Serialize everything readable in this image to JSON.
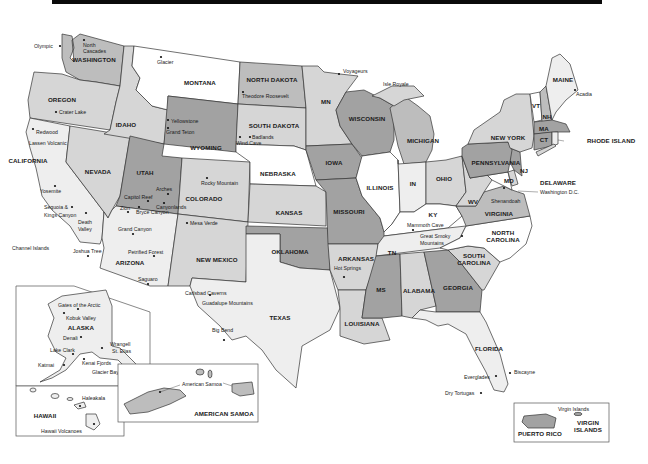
{
  "map": {
    "type": "US National Parks reference map",
    "colors": {
      "white": "#ffffff",
      "light": "#eeeeee",
      "medium": "#d6d6d6",
      "mediumdark": "#bdbdbd",
      "dark": "#a2a2a2",
      "border": "#333333",
      "topbar": "#0a0a0a"
    },
    "states": {
      "washington": "WASHINGTON",
      "oregon": "OREGON",
      "california": "CALIFORNIA",
      "nevada": "NEVADA",
      "idaho": "IDAHO",
      "montana": "MONTANA",
      "wyoming": "WYOMING",
      "utah": "UTAH",
      "colorado": "COLORADO",
      "arizona": "ARIZONA",
      "new_mexico": "NEW MEXICO",
      "north_dakota": "NORTH DAKOTA",
      "south_dakota": "SOUTH DAKOTA",
      "nebraska": "NEBRASKA",
      "kansas": "KANSAS",
      "oklahoma": "OKLAHOMA",
      "texas": "TEXAS",
      "minnesota": "MN",
      "iowa": "IOWA",
      "missouri": "MISSOURI",
      "arkansas": "ARKANSAS",
      "louisiana": "LOUISIANA",
      "wisconsin": "WISCONSIN",
      "illinois": "ILLINOIS",
      "michigan": "MICHIGAN",
      "indiana": "IN",
      "ohio": "OHIO",
      "kentucky": "KY",
      "tennessee": "TN",
      "mississippi": "MS",
      "alabama": "ALABAMA",
      "georgia": "GEORGIA",
      "florida": "FLORIDA",
      "south_carolina": "SOUTH CAROLINA",
      "north_carolina": "NORTH CAROLINA",
      "virginia": "VIRGINIA",
      "west_virginia": "WV",
      "maryland": "MD",
      "delaware": "DELAWARE",
      "new_jersey": "NJ",
      "pennsylvania": "PENNSYLVANIA",
      "new_york": "NEW YORK",
      "vermont": "VT",
      "new_hampshire": "NH",
      "maine": "MAINE",
      "massachusetts": "MA",
      "connecticut": "CT",
      "rhode_island": "RHODE ISLAND",
      "alaska": "ALASKA",
      "hawaii": "HAWAII",
      "american_samoa": "AMERICAN SAMOA",
      "puerto_rico": "PUERTO RICO",
      "virgin_islands": "VIRGIN ISLANDS"
    },
    "parks": {
      "olympic": "Olympic",
      "north_cascades_1": "North",
      "north_cascades_2": "Cascades",
      "glacier": "Glacier",
      "crater_lake": "Crater Lake",
      "redwood": "Redwood",
      "lassen": "Lassen Volcanic",
      "yellowstone": "Yellowstone",
      "grand_teton": "Grand Teton",
      "theodore_roosevelt": "Theodore Roosevelt",
      "badlands": "Badlands",
      "wind_cave": "Wind Cave",
      "voyageurs": "Voyageurs",
      "isle_royale": "Isle Royale",
      "acadia": "Acadia",
      "yosemite": "Yosemite",
      "sequoia_1": "Sequoia &",
      "sequoia_2": "Kings Canyon",
      "death_valley_1": "Death",
      "death_valley_2": "Valley",
      "channel_islands": "Channel Islands",
      "joshua_tree": "Joshua Tree",
      "arches": "Arches",
      "capitol_reef": "Capitol Reef",
      "canyonlands": "Canyonlands",
      "zion": "Zion",
      "bryce_canyon": "Bryce Canyon",
      "rocky_mountain": "Rocky Mountain",
      "mesa_verde": "Mesa Verde",
      "grand_canyon": "Grand Canyon",
      "petrified_forest": "Petrified Forest",
      "saguaro": "Saguaro",
      "carlsbad": "Carlsbad Caverns",
      "guadalupe": "Guadalupe Mountains",
      "big_bend": "Big Bend",
      "hot_springs": "Hot Springs",
      "mammoth_cave": "Mammoth Cave",
      "great_smoky_1": "Great Smoky",
      "great_smoky_2": "Mountains",
      "shenandoah": "Shenandoah",
      "washington_dc": "Washington D.C.",
      "everglades": "Everglades",
      "biscayne": "Biscayne",
      "dry_tortugas": "Dry Tortugas",
      "gates_arctic": "Gates of the Arctic",
      "kobuk_valley": "Kobuk Valley",
      "denali": "Denali",
      "lake_clark": "Lake Clark",
      "katmai": "Katmai",
      "kenai_fjords": "Kenai Fjords",
      "wrangell_1": "Wrangell",
      "wrangell_2": "St. Elias",
      "glacier_bay": "Glacier Bay",
      "haleakala": "Haleakala",
      "hawaii_volcanoes": "Hawaii Volcanoes",
      "american_samoa_park": "American Samoa",
      "virgin_islands_park": "Virgin Islands"
    }
  }
}
